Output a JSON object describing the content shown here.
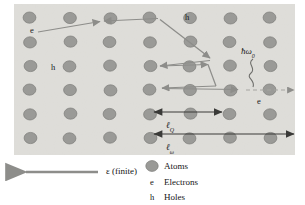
{
  "figure": {
    "lattice": {
      "bg_color": "#e2e1dd",
      "atom_color": "#9a9a97",
      "atom_stroke": "#7b7b78",
      "columns": 7,
      "rows": 6,
      "x0": 30,
      "y0": 18,
      "dx": 40,
      "dy": 24,
      "atom_rx": 6.4,
      "atom_ry": 5.6,
      "rect": {
        "x": 14,
        "y": 4,
        "w": 281,
        "h": 151
      }
    },
    "arrow_color": "#8d8d8a",
    "dark_arrow_color": "#3a3a38",
    "annotations": [
      {
        "name": "electron-label-top-left",
        "text": "e",
        "x": 33,
        "y": 31
      },
      {
        "name": "hole-label-top",
        "text": "h",
        "x": 186,
        "y": 18
      },
      {
        "name": "hole-label-left",
        "text": "h",
        "x": 52,
        "y": 69
      },
      {
        "name": "electron-label-right",
        "text": "e",
        "x": 258,
        "y": 103
      },
      {
        "name": "phonon-energy-label",
        "text": "ħω",
        "sub": "0",
        "x": 243,
        "y": 48
      },
      {
        "name": "length-q-label",
        "text": "ℓ",
        "sub": "Q",
        "x": 168,
        "y": 122
      },
      {
        "name": "length-omega-label",
        "text": "ℓ",
        "sub": "ω",
        "x": 168,
        "y": 143
      }
    ],
    "field": {
      "name": "field-arrow",
      "label": "ε (finite)",
      "label_x": 68,
      "label_y": 168,
      "arrow": {
        "x1": 98,
        "y1": 172,
        "x2": 22,
        "y2": 172
      }
    },
    "legend": {
      "items": [
        {
          "key": "atom-swatch",
          "symbol": "",
          "label": "Atoms"
        },
        {
          "key": "electron-key",
          "symbol": "e",
          "label": "Electrons"
        },
        {
          "key": "hole-key",
          "symbol": "h",
          "label": "Holes"
        }
      ]
    },
    "paths": {
      "electron_scatter": "M 38 32 L 104 22 L 160 19 L 212 60 L 158 66 L 200 64 L 216 91 L 160 87 L 240 90",
      "phonon_squiggle": "M 252 60 C 248 66, 257 68, 253 74 C 249 79, 256 80, 254 86",
      "dashed_segment": {
        "x1": 244,
        "y1": 90,
        "x2": 296,
        "y2": 90
      }
    },
    "measures": [
      {
        "name": "length-q-measure",
        "x1": 152,
        "y1": 112,
        "x2": 224,
        "y2": 112
      },
      {
        "name": "length-omega-measure",
        "x1": 152,
        "y1": 134,
        "x2": 296,
        "y2": 134
      }
    ],
    "colors": {
      "background": "#ffffff",
      "lattice_bg": "#e2e1dd",
      "atom": "#9a9a97",
      "gray_arrow": "#8d8d8a",
      "dark_arrow": "#3a3a38",
      "text": "#141414"
    }
  }
}
